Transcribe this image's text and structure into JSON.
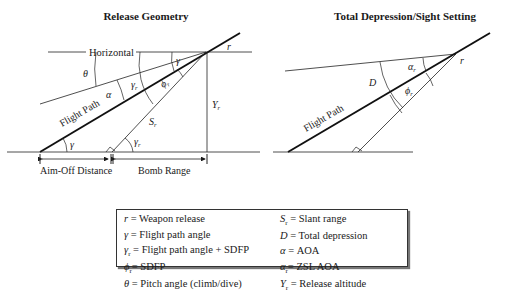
{
  "figure": {
    "left_panel": {
      "title": "Release Geometry",
      "labels": {
        "horizontal": "Horizontal",
        "release": "r",
        "theta": "θ",
        "alpha": "α",
        "gamma_r": "γr",
        "gamma_top": "γ",
        "phi_r": "φr",
        "y_r": "Yr",
        "s_r": "Sr",
        "flight_path": "Flight Path",
        "gamma_bottom": "γ",
        "gamma_r_bottom": "γr",
        "aim_off_distance": "Aim-Off Distance",
        "bomb_range": "Bomb Range"
      }
    },
    "right_panel": {
      "title": "Total Depression/Sight Setting",
      "labels": {
        "release": "r",
        "alpha_r": "αr",
        "d": "D",
        "phi_r": "φr",
        "flight_path": "Flight Path"
      }
    },
    "legend": {
      "left": [
        {
          "sym": "r",
          "sub": "",
          "text": " = Weapon release"
        },
        {
          "sym": "γ",
          "sub": "",
          "text": " = Flight path angle"
        },
        {
          "sym": "γ",
          "sub": "r",
          "text": " = Flight path angle + SDFP"
        },
        {
          "sym": "ϕ",
          "sub": "r",
          "text": "= SDFP"
        },
        {
          "sym": "θ",
          "sub": "",
          "text": " = Pitch angle (climb/dive)"
        }
      ],
      "right": [
        {
          "sym": "S",
          "sub": "r",
          "text": " = Slant range"
        },
        {
          "sym": "D",
          "sub": "",
          "text": " = Total depression"
        },
        {
          "sym": "α",
          "sub": "",
          "text": " = AOA"
        },
        {
          "sym": "α",
          "sub": "r",
          "text": "= ZSL AOA"
        },
        {
          "sym": "Y",
          "sub": "r",
          "text": " = Release altitude"
        }
      ]
    }
  }
}
